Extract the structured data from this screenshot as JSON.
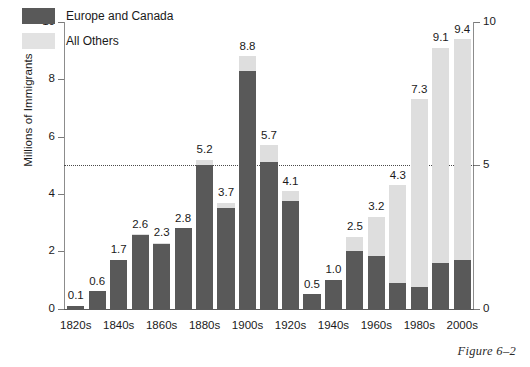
{
  "chart_data": {
    "type": "bar",
    "title": "",
    "xlabel": "",
    "ylabel": "Millions of Immigrants",
    "ylim": [
      0,
      10
    ],
    "yticks": [
      0,
      2,
      4,
      6,
      8,
      10
    ],
    "yticks_right": [
      0,
      5,
      10
    ],
    "grid": false,
    "reference_line": 5,
    "legend_position": "top-left",
    "stacked": true,
    "categories": [
      "1820s",
      "1830s",
      "1840s",
      "1850s",
      "1860s",
      "1870s",
      "1880s",
      "1890s",
      "1900s",
      "1910s",
      "1920s",
      "1930s",
      "1940s",
      "1950s",
      "1960s",
      "1970s",
      "1980s",
      "1990s",
      "2000s"
    ],
    "tick_labels": [
      "1820s",
      "",
      "1840s",
      "",
      "1860s",
      "",
      "1880s",
      "",
      "1900s",
      "",
      "1920s",
      "",
      "1940s",
      "",
      "1960s",
      "",
      "1980s",
      "",
      "2000s"
    ],
    "totals": [
      0.1,
      0.6,
      1.7,
      2.6,
      2.3,
      2.8,
      5.2,
      3.7,
      8.8,
      5.7,
      4.1,
      0.5,
      1.0,
      2.5,
      3.2,
      4.3,
      7.3,
      9.1,
      9.4
    ],
    "data_labels": [
      "0.1",
      "0.6",
      "1.7",
      "2.6",
      "2.3",
      "2.8",
      "5.2",
      "3.7",
      "8.8",
      "5.7",
      "4.1",
      "0.5",
      "1.0",
      "2.5",
      "3.2",
      "4.3",
      "7.3",
      "9.1",
      "9.4"
    ],
    "series": [
      {
        "name": "Europe and Canada",
        "color": "#595959",
        "values": [
          0.1,
          0.6,
          1.7,
          2.55,
          2.25,
          2.8,
          5.0,
          3.5,
          8.3,
          5.1,
          3.75,
          0.5,
          1.0,
          2.0,
          1.85,
          0.9,
          0.75,
          1.6,
          1.7
        ]
      },
      {
        "name": "All Others",
        "color": "#dedede",
        "values": [
          0.0,
          0.0,
          0.0,
          0.05,
          0.05,
          0.0,
          0.2,
          0.2,
          0.5,
          0.6,
          0.35,
          0.0,
          0.0,
          0.5,
          1.35,
          3.4,
          6.55,
          7.5,
          7.7
        ]
      }
    ]
  },
  "legend": {
    "items": [
      {
        "label": "Europe and Canada",
        "swatch": "dark"
      },
      {
        "label": "All Others",
        "swatch": "light"
      }
    ]
  },
  "caption": {
    "text": "Figure 6–2"
  }
}
